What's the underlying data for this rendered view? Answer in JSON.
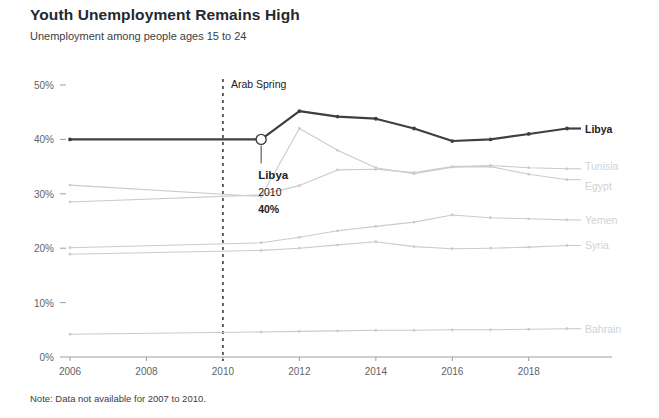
{
  "header": {
    "title": "Youth Unemployment Remains High",
    "subtitle": "Unemployment among people ages 15 to 24"
  },
  "footer": {
    "note": "Note: Data not available for 2007 to 2010."
  },
  "annotations": {
    "event_label": "Arab Spring",
    "event_year": 2010,
    "callout": {
      "name": "Libya",
      "year": "2010",
      "value": "40%"
    }
  },
  "colors": {
    "highlight": "#3c4043",
    "muted": "#c8cbd0",
    "muted_text": "#cfd2d6",
    "axis": "#9aa0a6",
    "background": "#ffffff"
  },
  "chart_data": {
    "type": "line",
    "title": "Youth Unemployment Remains High",
    "subtitle": "Unemployment among people ages 15 to 24",
    "xlabel": "",
    "ylabel": "",
    "xlim": [
      2006,
      2019
    ],
    "ylim": [
      0,
      50
    ],
    "yticks": [
      0,
      10,
      20,
      30,
      40,
      50
    ],
    "ytick_labels": [
      "0%",
      "10%",
      "20%",
      "30%",
      "40%",
      "50%"
    ],
    "xticks": [
      2006,
      2008,
      2010,
      2012,
      2014,
      2016,
      2018
    ],
    "xtick_labels": [
      "2006",
      "2008",
      "2010",
      "2012",
      "2014",
      "2016",
      "2018"
    ],
    "grid": false,
    "legend_position": "right-inline",
    "x": [
      2006,
      2011,
      2012,
      2013,
      2014,
      2015,
      2016,
      2017,
      2018,
      2019
    ],
    "series": [
      {
        "name": "Libya",
        "highlight": true,
        "values": [
          40.0,
          40.0,
          45.2,
          44.2,
          43.8,
          42.0,
          39.7,
          40.0,
          41.0,
          42.0
        ]
      },
      {
        "name": "Tunisia",
        "highlight": false,
        "values": [
          28.5,
          29.8,
          31.5,
          34.4,
          34.5,
          33.9,
          35.0,
          35.2,
          34.8,
          34.6
        ]
      },
      {
        "name": "Egypt",
        "highlight": false,
        "values": [
          31.6,
          29.5,
          42.0,
          38.0,
          34.8,
          33.7,
          34.9,
          35.0,
          33.6,
          32.6
        ]
      },
      {
        "name": "Yemen",
        "highlight": false,
        "values": [
          20.1,
          21.0,
          22.0,
          23.2,
          24.0,
          24.8,
          26.1,
          25.6,
          25.4,
          25.2
        ]
      },
      {
        "name": "Syria",
        "highlight": false,
        "values": [
          18.9,
          19.6,
          20.0,
          20.6,
          21.2,
          20.3,
          19.9,
          20.0,
          20.2,
          20.5
        ]
      },
      {
        "name": "Bahrain",
        "highlight": false,
        "values": [
          4.2,
          4.6,
          4.7,
          4.8,
          4.9,
          4.9,
          5.0,
          5.0,
          5.1,
          5.2
        ]
      }
    ]
  }
}
